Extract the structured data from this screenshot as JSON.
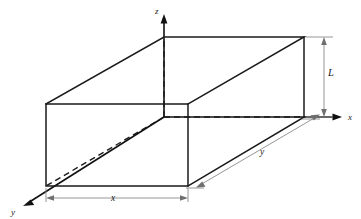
{
  "figure": {
    "type": "3d-box-diagram",
    "colors": {
      "edge": "#1a1a1a",
      "hidden_edge": "#1a1a1a",
      "axis": "#111111",
      "dimension_line": "#8a8a8a",
      "background": "#ffffff"
    },
    "axes": [
      {
        "id": "z",
        "label": "z",
        "direction": "up",
        "label_x": 159,
        "label_y": 12
      },
      {
        "id": "x",
        "label": "x",
        "direction": "right",
        "label_x": 348,
        "label_y": 120
      },
      {
        "id": "y",
        "label": "y",
        "direction": "down-left",
        "label_x": 14,
        "label_y": 212
      }
    ],
    "dimensions": [
      {
        "id": "width",
        "label": "x",
        "orientation": "horizontal-bottom",
        "label_x": 113,
        "label_y": 207
      },
      {
        "id": "depth",
        "label": "y",
        "orientation": "diagonal-right",
        "label_x": 262,
        "label_y": 161
      },
      {
        "id": "height",
        "label": "L",
        "orientation": "vertical-right",
        "label_x": 328,
        "label_y": 76
      }
    ],
    "geometry": {
      "origin": {
        "x": 164,
        "y": 117
      },
      "front_top_left": {
        "x": 46,
        "y": 104
      },
      "front_bottom_left": {
        "x": 46,
        "y": 186
      },
      "front_bottom_right": {
        "x": 188,
        "y": 186
      },
      "front_top_right": {
        "x": 188,
        "y": 104
      },
      "back_top_left": {
        "x": 164,
        "y": 37
      },
      "back_top_right": {
        "x": 304,
        "y": 37
      },
      "back_bottom_right": {
        "x": 304,
        "y": 117
      }
    }
  }
}
